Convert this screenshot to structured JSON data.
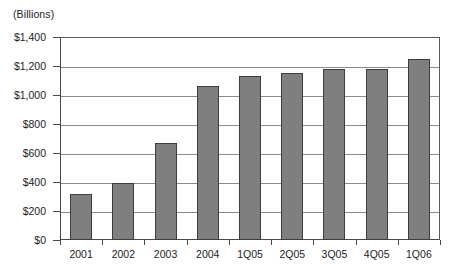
{
  "chart_data": {
    "type": "bar",
    "title": "",
    "subtitle": "",
    "units_caption": "(Billions)",
    "xlabel": "",
    "ylabel": "",
    "categories": [
      "2001",
      "2002",
      "2003",
      "2004",
      "1Q05",
      "2Q05",
      "3Q05",
      "4Q05",
      "1Q06"
    ],
    "values": [
      320,
      390,
      670,
      1060,
      1130,
      1150,
      1180,
      1180,
      1250
    ],
    "series": [
      {
        "name": "",
        "values": [
          320,
          390,
          670,
          1060,
          1130,
          1150,
          1180,
          1180,
          1250
        ]
      }
    ],
    "ylim": [
      0,
      1400
    ],
    "ytick_values": [
      0,
      200,
      400,
      600,
      800,
      1000,
      1200,
      1400
    ],
    "ytick_labels": [
      "$0",
      "$200",
      "$400",
      "$600",
      "$800",
      "$1,000",
      "$1,200",
      "$1,400"
    ],
    "grid": true,
    "grid_axis": "y",
    "legend": false,
    "legend_position": "none",
    "bar_color": "#7f7f7f",
    "bar_border_color": "#3d3d3d",
    "gridline_color": "#8c8c8c",
    "axis_color": "#4a4a4a",
    "background_color": "#ffffff",
    "annotations": []
  }
}
